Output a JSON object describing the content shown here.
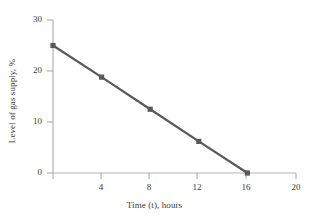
{
  "chart_data": {
    "type": "line",
    "title": "",
    "xlabel": "Time (t), hours",
    "ylabel": "Level of gas supply, %",
    "x": [
      0,
      4,
      8,
      12,
      16
    ],
    "values": [
      25,
      18.8,
      12.5,
      6.2,
      0
    ],
    "series": [
      {
        "name": "Level of gas supply",
        "x": [
          0,
          4,
          8,
          12,
          16
        ],
        "values": [
          25,
          18.8,
          12.5,
          6.2,
          0
        ]
      }
    ],
    "xlim": [
      0,
      20
    ],
    "ylim": [
      0,
      30
    ],
    "xticks": [
      0,
      4,
      8,
      12,
      16,
      20
    ],
    "xtick_labels": [
      "",
      "4",
      "8",
      "12",
      "16",
      "20"
    ],
    "yticks": [
      0,
      10,
      20,
      30
    ],
    "ytick_labels": [
      "0",
      "10",
      "20",
      "30"
    ],
    "grid": false,
    "legend": false,
    "marker": "square",
    "line_color": "#595959",
    "marker_color": "#595959",
    "axis_color": "#b3b3b3",
    "background": "#ffffff"
  }
}
